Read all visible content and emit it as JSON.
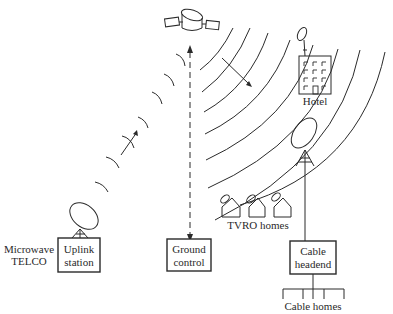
{
  "diagram": {
    "nodes": {
      "satellite": {
        "label": ""
      },
      "uplink": {
        "label_line1": "Uplink",
        "label_line2": "station"
      },
      "microwave": {
        "label_line1": "Microwave",
        "label_line2": "TELCO"
      },
      "ground_control": {
        "label_line1": "Ground",
        "label_line2": "control"
      },
      "hotel": {
        "label": "Hotel"
      },
      "tvro": {
        "label": "TVRO homes"
      },
      "cable_headend": {
        "label_line1": "Cable",
        "label_line2": "headend"
      },
      "cable_homes": {
        "label": "Cable homes"
      }
    },
    "edges": [
      {
        "from": "uplink",
        "to": "satellite",
        "style": "radio-arcs",
        "direction": "up"
      },
      {
        "from": "ground_control",
        "to": "satellite",
        "style": "dashed",
        "direction": "bidirectional"
      },
      {
        "from": "satellite",
        "to": "hotel",
        "style": "broadcast-arcs"
      },
      {
        "from": "satellite",
        "to": "tvro",
        "style": "broadcast-arcs"
      },
      {
        "from": "satellite",
        "to": "cable_headend",
        "style": "broadcast-arcs"
      },
      {
        "from": "cable_headend",
        "to": "cable_homes",
        "style": "solid-tree"
      }
    ],
    "colors": {
      "ink": "#2a2a2a",
      "background": "#ffffff"
    }
  }
}
